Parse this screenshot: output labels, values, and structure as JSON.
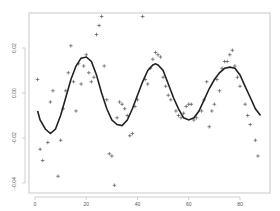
{
  "chart_data": {
    "type": "scatter",
    "title": "",
    "xlabel": "",
    "ylabel": "",
    "xlim": [
      -2.3,
      91.7
    ],
    "ylim": [
      -0.0446,
      0.0355
    ],
    "grid": false,
    "legend": null,
    "x_ticks": [
      0,
      20,
      40,
      60,
      80
    ],
    "x_tick_labels": [
      "0",
      "20",
      "40",
      "60",
      "80"
    ],
    "y_ticks": [
      0.02,
      0.0,
      -0.02,
      -0.04
    ],
    "y_tick_labels": [
      "0.02",
      "0.00",
      "-0.02",
      "-0.04"
    ],
    "series": [
      {
        "name": "observations",
        "marker": "+",
        "color": "#555555",
        "points": [
          [
            1,
            0.006
          ],
          [
            2,
            -0.025
          ],
          [
            3,
            -0.03
          ],
          [
            5,
            -0.022
          ],
          [
            6,
            -0.004
          ],
          [
            7,
            0.001
          ],
          [
            9,
            -0.037
          ],
          [
            10,
            -0.021
          ],
          [
            11,
            -0.007
          ],
          [
            12,
            0.001
          ],
          [
            13,
            0.009
          ],
          [
            14,
            0.021
          ],
          [
            15,
            0.005
          ],
          [
            16,
            -0.008
          ],
          [
            17,
            0.013
          ],
          [
            18,
            0.004
          ],
          [
            19,
            0.012
          ],
          [
            20,
            0.017
          ],
          [
            21,
            0.009
          ],
          [
            22,
            0.005
          ],
          [
            23,
            0.007
          ],
          [
            24,
            0.026
          ],
          [
            25,
            0.03
          ],
          [
            26,
            0.034
          ],
          [
            27,
            0.012
          ],
          [
            28,
            -0.003
          ],
          [
            29,
            -0.027
          ],
          [
            30,
            -0.028
          ],
          [
            31,
            -0.041
          ],
          [
            32,
            -0.011
          ],
          [
            33,
            -0.004
          ],
          [
            34,
            -0.005
          ],
          [
            35,
            -0.007
          ],
          [
            36,
            -0.01
          ],
          [
            37,
            -0.019
          ],
          [
            38,
            -0.018
          ],
          [
            39,
            -0.006
          ],
          [
            40,
            -0.003
          ],
          [
            42,
            0.034
          ],
          [
            43,
            0.006
          ],
          [
            44,
            0.004
          ],
          [
            45,
            0.011
          ],
          [
            46,
            0.015
          ],
          [
            47,
            0.018
          ],
          [
            48,
            0.017
          ],
          [
            49,
            0.016
          ],
          [
            50,
            0.007
          ],
          [
            51,
            0.003
          ],
          [
            52,
            -0.001
          ],
          [
            53,
            -0.003
          ],
          [
            55,
            -0.008
          ],
          [
            56,
            -0.01
          ],
          [
            57,
            -0.011
          ],
          [
            58,
            -0.009
          ],
          [
            59,
            -0.006
          ],
          [
            60,
            -0.005
          ],
          [
            61,
            -0.005
          ],
          [
            62,
            -0.012
          ],
          [
            63,
            -0.011
          ],
          [
            65,
            -0.008
          ],
          [
            66,
            -0.003
          ],
          [
            67,
            0.005
          ],
          [
            68,
            -0.015
          ],
          [
            69,
            -0.008
          ],
          [
            70,
            -0.005
          ],
          [
            71,
            0.006
          ],
          [
            72,
            0.001
          ],
          [
            73,
            0.011
          ],
          [
            74,
            0.014
          ],
          [
            75,
            0.014
          ],
          [
            76,
            0.017
          ],
          [
            77,
            0.019
          ],
          [
            78,
            0.012
          ],
          [
            79,
            0.007
          ],
          [
            80,
            0.003
          ],
          [
            82,
            -0.005
          ],
          [
            83,
            -0.01
          ],
          [
            84,
            -0.014
          ],
          [
            86,
            -0.021
          ],
          [
            87,
            -0.028
          ]
        ]
      },
      {
        "name": "fitted curve",
        "type": "line",
        "color": "#222222",
        "points": [
          [
            1,
            -0.008
          ],
          [
            2,
            -0.012
          ],
          [
            4,
            -0.016
          ],
          [
            6,
            -0.018
          ],
          [
            8,
            -0.016
          ],
          [
            10,
            -0.01
          ],
          [
            12,
            -0.002
          ],
          [
            14,
            0.006
          ],
          [
            16,
            0.012
          ],
          [
            18,
            0.0155
          ],
          [
            20,
            0.016
          ],
          [
            22,
            0.014
          ],
          [
            24,
            0.008
          ],
          [
            26,
            0.0
          ],
          [
            28,
            -0.007
          ],
          [
            30,
            -0.012
          ],
          [
            32,
            -0.014
          ],
          [
            34,
            -0.0145
          ],
          [
            36,
            -0.012
          ],
          [
            38,
            -0.007
          ],
          [
            40,
            -0.001
          ],
          [
            42,
            0.005
          ],
          [
            44,
            0.01
          ],
          [
            46,
            0.0125
          ],
          [
            47,
            0.013
          ],
          [
            48,
            0.0125
          ],
          [
            50,
            0.01
          ],
          [
            52,
            0.004
          ],
          [
            54,
            -0.002
          ],
          [
            56,
            -0.007
          ],
          [
            58,
            -0.011
          ],
          [
            60,
            -0.012
          ],
          [
            62,
            -0.011
          ],
          [
            64,
            -0.008
          ],
          [
            66,
            -0.003
          ],
          [
            68,
            0.002
          ],
          [
            70,
            0.006
          ],
          [
            72,
            0.009
          ],
          [
            74,
            0.011
          ],
          [
            76,
            0.0115
          ],
          [
            78,
            0.011
          ],
          [
            80,
            0.008
          ],
          [
            82,
            0.003
          ],
          [
            84,
            -0.002
          ],
          [
            86,
            -0.007
          ],
          [
            88,
            -0.01
          ]
        ]
      }
    ]
  }
}
